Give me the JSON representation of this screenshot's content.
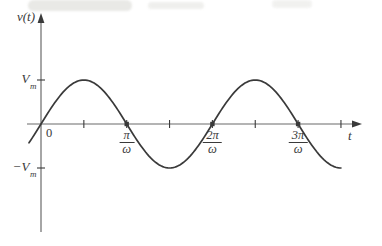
{
  "figure": {
    "background": "#ffffff",
    "ink_color": "#3a3a3a",
    "axis_color": "#6b6b6b"
  },
  "chart_data": {
    "type": "line",
    "title": "",
    "function": "v(t) = Vm sin(ωt)",
    "xlabel": "t",
    "ylabel": "v(t)",
    "x_unit": "π/ω",
    "x_start_units": -0.14,
    "x_end_units": 3.5,
    "amplitude_units": 1,
    "x_tick_units": [
      0.5,
      1,
      1.5,
      2,
      2.5,
      3,
      3.5
    ],
    "zero_crossing_units": [
      1,
      2,
      3
    ],
    "y_tick_units": [
      1,
      -1
    ],
    "ylim": [
      -1,
      1
    ],
    "grid": false,
    "legend": "none",
    "labels": {
      "origin": "0",
      "x_axis": "t",
      "y_axis": "v(t)",
      "vm": {
        "base": "V",
        "sub": "m"
      },
      "neg_vm": {
        "sign": "−",
        "base": "V",
        "sub": "m"
      },
      "x_fractions": [
        {
          "num": "π",
          "den": "ω",
          "at_units": 1
        },
        {
          "num": "2π",
          "den": "ω",
          "at_units": 2
        },
        {
          "num": "3π",
          "den": "ω",
          "at_units": 3
        }
      ]
    }
  }
}
